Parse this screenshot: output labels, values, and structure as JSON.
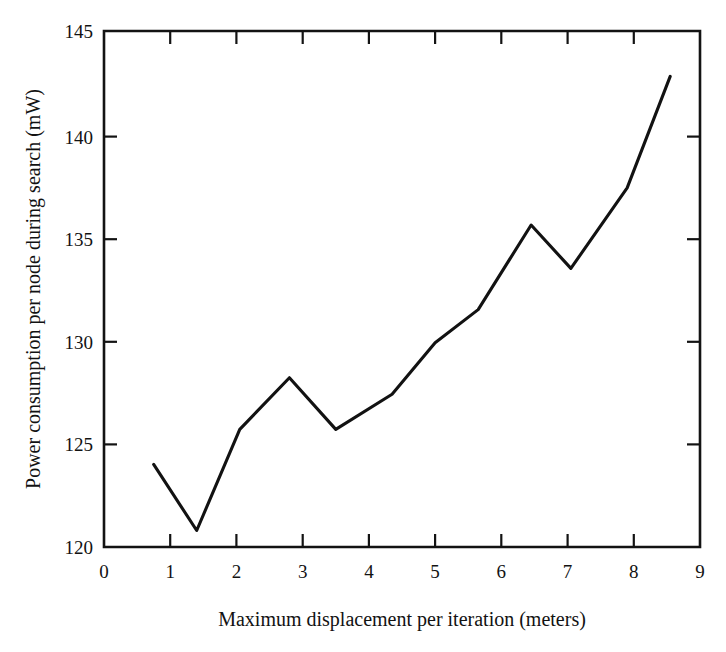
{
  "chart_data": {
    "type": "line",
    "title": "",
    "xlabel": "Maximum displacement per iteration (meters)",
    "ylabel": "Power consumption per node during search (mW)",
    "xlim": [
      0,
      9
    ],
    "ylim": [
      120,
      145
    ],
    "xticks": [
      "0",
      "1",
      "2",
      "3",
      "4",
      "5",
      "6",
      "7",
      "8",
      "9"
    ],
    "yticks": [
      "120",
      "125",
      "130",
      "135",
      "140",
      "145"
    ],
    "grid": false,
    "legend": "none",
    "line_color": "#121212",
    "series": [
      {
        "name": "Power consumption per node during search",
        "x": [
          0.75,
          1.4,
          2.05,
          2.8,
          3.5,
          4.35,
          5.0,
          5.65,
          6.45,
          7.05,
          7.9,
          8.55
        ],
        "values": [
          124.0,
          120.8,
          125.7,
          128.2,
          125.7,
          127.4,
          129.9,
          131.5,
          135.6,
          133.5,
          137.4,
          142.8
        ]
      }
    ]
  },
  "axes": {
    "x_axis_title": "Maximum displacement per iteration (meters)",
    "y_axis_title": "Power consumption per node during search (mW)",
    "x_tick_labels": [
      "0",
      "1",
      "2",
      "3",
      "4",
      "5",
      "6",
      "7",
      "8",
      "9"
    ],
    "y_tick_labels": [
      "120",
      "125",
      "130",
      "135",
      "140",
      "145"
    ]
  }
}
